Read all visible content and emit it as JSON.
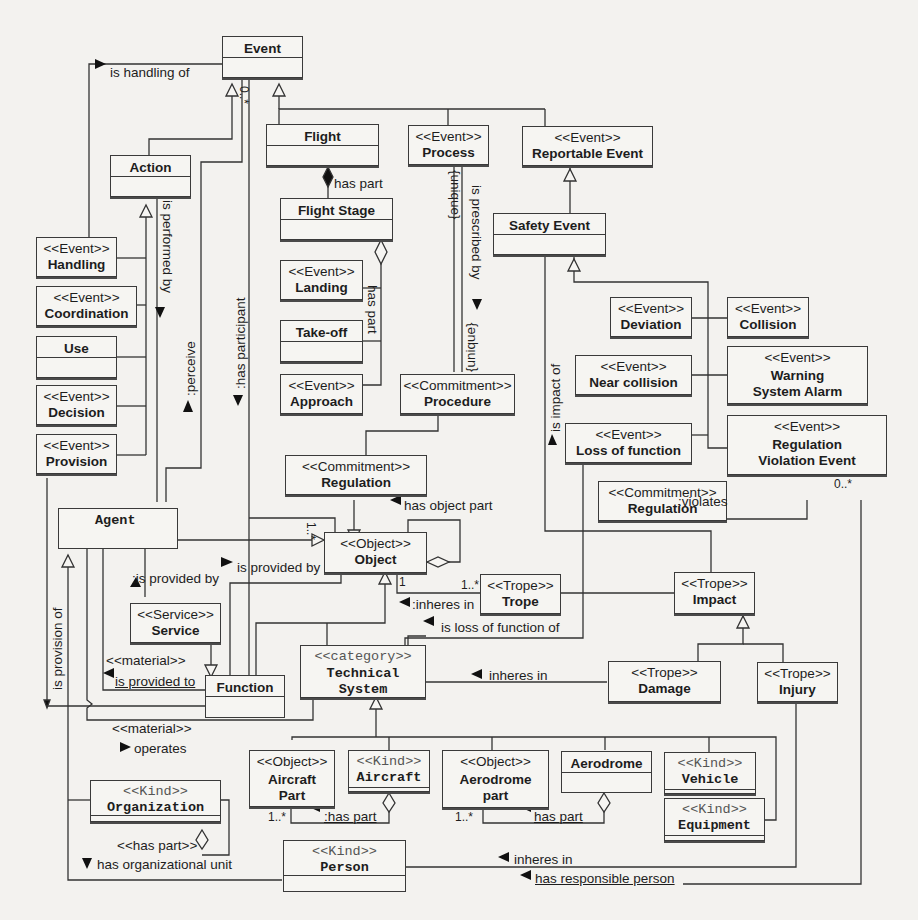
{
  "diagram": {
    "type": "UML class diagram",
    "classes": {
      "event": {
        "stereotype": "",
        "name": "Event"
      },
      "action": {
        "stereotype": "",
        "name": "Action"
      },
      "flight": {
        "stereotype": "",
        "name": "Flight"
      },
      "process": {
        "stereotype": "<<Event>>",
        "name": "Process"
      },
      "reportable_event": {
        "stereotype": "<<Event>>",
        "name": "Reportable Event"
      },
      "flight_stage": {
        "stereotype": "",
        "name": "Flight Stage"
      },
      "safety_event": {
        "stereotype": "",
        "name": "Safety Event"
      },
      "handling": {
        "stereotype": "<<Event>>",
        "name": "Handling"
      },
      "coordination": {
        "stereotype": "<<Event>>",
        "name": "Coordination"
      },
      "use": {
        "stereotype": "",
        "name": "Use"
      },
      "decision": {
        "stereotype": "<<Event>>",
        "name": "Decision"
      },
      "provision": {
        "stereotype": "<<Event>>",
        "name": "Provision"
      },
      "landing": {
        "stereotype": "<<Event>>",
        "name": "Landing"
      },
      "take_off": {
        "stereotype": "",
        "name": "Take-off"
      },
      "approach": {
        "stereotype": "<<Event>>",
        "name": "Approach"
      },
      "procedure": {
        "stereotype": "<<Commitment>>",
        "name": "Procedure"
      },
      "deviation": {
        "stereotype": "<<Event>>",
        "name": "Deviation"
      },
      "collision": {
        "stereotype": "<<Event>>",
        "name": "Collision"
      },
      "near_collision": {
        "stereotype": "<<Event>>",
        "name": "Near collision"
      },
      "warning_system_alarm": {
        "stereotype": "<<Event>>",
        "name": "Warning System Alarm"
      },
      "loss_of_function": {
        "stereotype": "<<Event>>",
        "name": "Loss of function"
      },
      "regulation_violation_event": {
        "stereotype": "<<Event>>",
        "name": "Regulation Violation Event"
      },
      "regulation_top": {
        "stereotype": "<<Commitment>>",
        "name": "Regulation"
      },
      "regulation_right": {
        "stereotype": "<<Commitment>>",
        "name": "Regulation"
      },
      "agent": {
        "stereotype": "",
        "name": "Agent"
      },
      "object": {
        "stereotype": "<<Object>>",
        "name": "Object"
      },
      "service": {
        "stereotype": "<<Service>>",
        "name": "Service"
      },
      "trope": {
        "stereotype": "<<Trope>>",
        "name": "Trope"
      },
      "impact": {
        "stereotype": "<<Trope>>",
        "name": "Impact"
      },
      "function": {
        "stereotype": "",
        "name": "Function"
      },
      "technical_system": {
        "stereotype": "<<category>>",
        "name": "Technical System"
      },
      "damage": {
        "stereotype": "<<Trope>>",
        "name": "Damage"
      },
      "injury": {
        "stereotype": "<<Trope>>",
        "name": "Injury"
      },
      "aircraft_part": {
        "stereotype": "<<Object>>",
        "name": "Aircraft Part"
      },
      "aircraft": {
        "stereotype": "<<Kind>>",
        "name": "Aircraft"
      },
      "aerodrome_part": {
        "stereotype": "<<Object>>",
        "name": "Aerodrome part"
      },
      "aerodrome": {
        "stereotype": "",
        "name": "Aerodrome"
      },
      "vehicle": {
        "stereotype": "<<Kind>>",
        "name": "Vehicle"
      },
      "equipment": {
        "stereotype": "<<Kind>>",
        "name": "Equipment"
      },
      "organization": {
        "stereotype": "<<Kind>>",
        "name": "Organization"
      },
      "person": {
        "stereotype": "<<Kind>>",
        "name": "Person"
      }
    },
    "labels": {
      "is_handling_of": "is handling of",
      "is_performed_by": "is performed by",
      "perceive": ":perceive",
      "has_participant": ":has participant",
      "has_part_flight": "has part",
      "has_part_stage": "has part",
      "unique_1": "{unique}",
      "is_prescribed_by": "is prescribed by",
      "unique_2": "{unique}",
      "is_impact_of": "is impact of",
      "has_object_part": "has object part",
      "is_provided_by_service": ":is provided by",
      "is_provided_by_function": "is provided by",
      "violates": ":violates",
      "inheres_in_trope": ":inheres in",
      "is_loss_of_function_of": "is loss of function of",
      "is_provision_of": "is provision of",
      "material_1": "<<material>>",
      "is_provided_to": "is provided to",
      "inheres_in_damage": "inheres in",
      "material_2": "<<material>>",
      "operates": "operates",
      "has_part_aircraft": ":has part",
      "has_part_aerodrome": "has part",
      "has_part_org": "<<has part>>",
      "has_organizational_unit": "has organizational unit",
      "inheres_in_person": "inheres in",
      "has_responsible_person": "has responsible person"
    },
    "multiplicities": {
      "event_participant": "0..*",
      "object_participant": "1..*",
      "object_trope": "1",
      "trope_object": "1..*",
      "rve_person": "0..*",
      "aircraft_part": "1..*",
      "aerodrome_part": "1..*"
    }
  }
}
